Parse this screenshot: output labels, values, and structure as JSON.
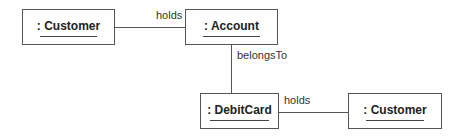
{
  "diagram": {
    "type": "UML object diagram",
    "objects": [
      {
        "id": "customer1",
        "label": ": Customer"
      },
      {
        "id": "account",
        "label": ": Account"
      },
      {
        "id": "debitcard",
        "label": ": DebitCard"
      },
      {
        "id": "customer2",
        "label": ": Customer"
      }
    ],
    "links": [
      {
        "from": "customer1",
        "to": "account",
        "label": "holds"
      },
      {
        "from": "account",
        "to": "debitcard",
        "label": "belongsTo"
      },
      {
        "from": "debitcard",
        "to": "customer2",
        "label": "holds"
      }
    ]
  }
}
